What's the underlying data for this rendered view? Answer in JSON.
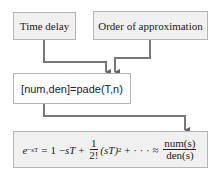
{
  "diagram": {
    "inputs": [
      {
        "label": "Time delay"
      },
      {
        "label": "Order of approximation"
      }
    ],
    "function_box": {
      "label": "[num,den]=pade(T,n)"
    },
    "output_equation": {
      "lhs_base": "e",
      "lhs_exp": "−sT",
      "eq": "=",
      "term1": "1 − ",
      "term2": "sT",
      "plus1": " + ",
      "frac1_num": "1",
      "frac1_den": "2!",
      "term3": "(sT)",
      "term3_exp": "2",
      "tail": " + · · · ≈ ",
      "frac2_num": "num(s)",
      "frac2_den": "den(s)"
    },
    "colors": {
      "box_fill": "#f0f0f0",
      "box_border": "#b4b4b4",
      "arrow": "#666666"
    }
  }
}
